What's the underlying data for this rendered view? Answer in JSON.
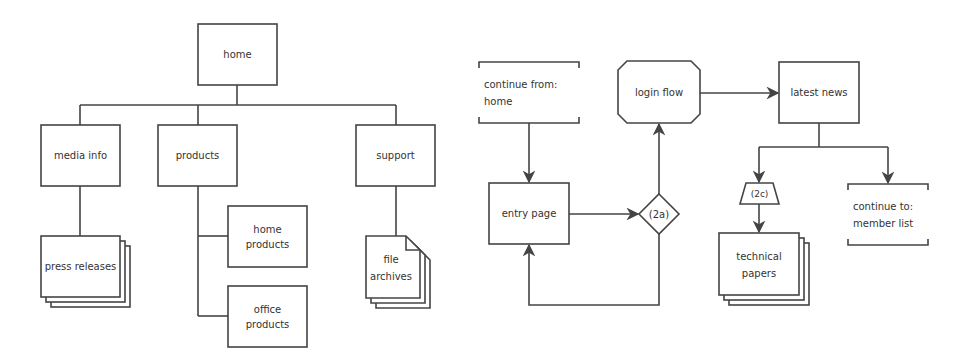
{
  "colors": {
    "stroke": "#444444",
    "text": "#333333",
    "background": "#ffffff"
  },
  "sitemap": {
    "home": {
      "label": "home"
    },
    "media_info": {
      "label": "media info"
    },
    "products": {
      "label": "products"
    },
    "support": {
      "label": "support"
    },
    "press_releases": {
      "label": "press releases"
    },
    "home_products": {
      "line1": "home",
      "line2": "products"
    },
    "office_products": {
      "line1": "office",
      "line2": "products"
    },
    "file_archives": {
      "line1": "file",
      "line2": "archives"
    }
  },
  "flow": {
    "continue_from": {
      "line1": "continue from:",
      "line2": "home"
    },
    "entry_page": {
      "label": "entry page"
    },
    "decision_2a": {
      "label": "(2a)"
    },
    "login_flow": {
      "label": "login flow"
    },
    "latest_news": {
      "label": "latest news"
    },
    "condition_2c": {
      "label": "(2c)"
    },
    "technical_papers": {
      "line1": "technical",
      "line2": "papers"
    },
    "continue_to": {
      "line1": "continue to:",
      "line2": "member list"
    }
  }
}
